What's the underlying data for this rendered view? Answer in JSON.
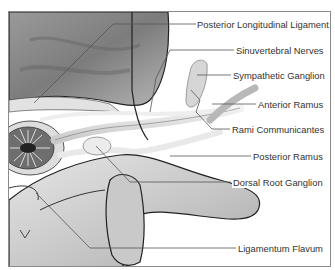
{
  "diagram": {
    "type": "anatomical-illustration",
    "labels": [
      {
        "id": "posterior-longitudinal-ligament",
        "text": "Posterior Longitudinal Ligament",
        "x": 196,
        "y": 19
      },
      {
        "id": "sinuvertebral-nerves",
        "text": "Sinuvertebral Nerves",
        "x": 235,
        "y": 45
      },
      {
        "id": "sympathetic-ganglion",
        "text": "Sympathetic Ganglion",
        "x": 232,
        "y": 70
      },
      {
        "id": "anterior-ramus",
        "text": "Anterior Ramus",
        "x": 257,
        "y": 99
      },
      {
        "id": "rami-communicantes",
        "text": "Rami Communicantes",
        "x": 231,
        "y": 124
      },
      {
        "id": "posterior-ramus",
        "text": "Posterior Ramus",
        "x": 252,
        "y": 151
      },
      {
        "id": "dorsal-root-ganglion",
        "text": "Dorsal Root Ganglion",
        "x": 232,
        "y": 177
      },
      {
        "id": "ligamentum-flavum",
        "text": "Ligamentum Flavum",
        "x": 237,
        "y": 243
      }
    ]
  }
}
